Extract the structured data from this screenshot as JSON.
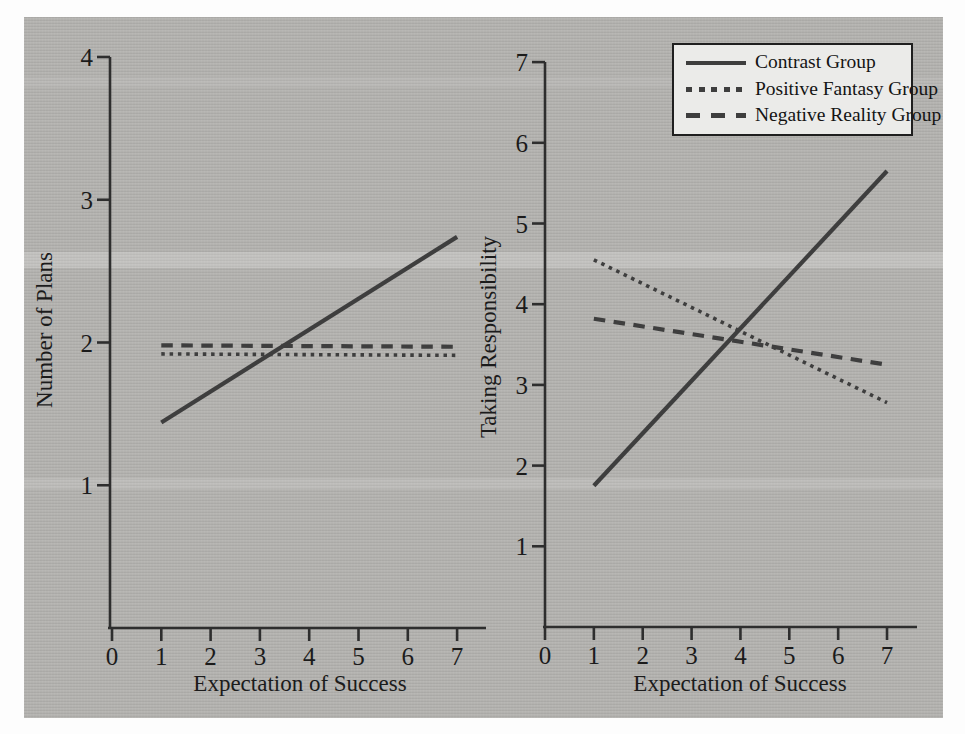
{
  "figure": {
    "panel_count": 2
  },
  "colors": {
    "paper_gray": "#b2b1ae",
    "line": "#3e3e3e",
    "axis": "#2e2e2e",
    "text": "#1b1b1b",
    "legend_background": "#ebebe9",
    "page_background": "#fdfdfd"
  },
  "chart_data": [
    {
      "type": "line",
      "title": "",
      "xlabel": "Expectation of Success",
      "ylabel": "Number of Plans",
      "xlim": [
        0,
        7.6
      ],
      "ylim": [
        0,
        4
      ],
      "xticks": [
        0,
        1,
        2,
        3,
        4,
        5,
        6,
        7
      ],
      "yticks": [
        1,
        2,
        3,
        4
      ],
      "grid": false,
      "series": [
        {
          "name": "Contrast Group",
          "style": "solid",
          "x": [
            1,
            7
          ],
          "y": [
            1.44,
            2.74
          ]
        },
        {
          "name": "Positive Fantasy Group",
          "style": "dotted",
          "x": [
            1,
            7
          ],
          "y": [
            1.92,
            1.91
          ]
        },
        {
          "name": "Negative Reality Group",
          "style": "dashed",
          "x": [
            1,
            7
          ],
          "y": [
            1.98,
            1.97
          ]
        }
      ]
    },
    {
      "type": "line",
      "title": "",
      "xlabel": "Expectation of Success",
      "ylabel": "Taking Responsibility",
      "xlim": [
        0,
        7.6
      ],
      "ylim": [
        0,
        7
      ],
      "xticks": [
        0,
        1,
        2,
        3,
        4,
        5,
        6,
        7
      ],
      "yticks": [
        1,
        2,
        3,
        4,
        5,
        6,
        7
      ],
      "grid": false,
      "series": [
        {
          "name": "Contrast Group",
          "style": "solid",
          "x": [
            1,
            7
          ],
          "y": [
            1.75,
            5.65
          ]
        },
        {
          "name": "Positive Fantasy Group",
          "style": "dotted",
          "x": [
            1,
            7
          ],
          "y": [
            4.55,
            2.78
          ]
        },
        {
          "name": "Negative Reality Group",
          "style": "dashed",
          "x": [
            1,
            7
          ],
          "y": [
            3.82,
            3.25
          ]
        }
      ],
      "legend": {
        "position": "top-right",
        "entries": [
          {
            "label": "Contrast Group",
            "style": "solid"
          },
          {
            "label": "Positive Fantasy Group",
            "style": "dotted"
          },
          {
            "label": "Negative Reality Group",
            "style": "dashed"
          }
        ]
      }
    }
  ]
}
